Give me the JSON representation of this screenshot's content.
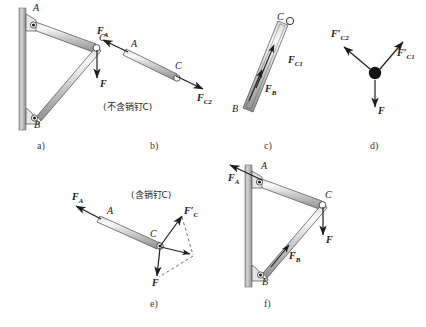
{
  "figure": {
    "background": "#ffffff",
    "ink": "#2b2b2b",
    "bar_fill_light": "#f2f2f2",
    "bar_fill_mid": "#b9b9b9",
    "wall_fill": "#b5b5b5"
  },
  "panels": [
    {
      "id": "a",
      "label": "a)",
      "caption": ""
    },
    {
      "id": "b",
      "label": "b)",
      "caption": "(不含销钉C)"
    },
    {
      "id": "c",
      "label": "c)",
      "caption": ""
    },
    {
      "id": "d",
      "label": "d)",
      "caption": ""
    },
    {
      "id": "e",
      "label": "e)",
      "caption": "(含销钉C)"
    },
    {
      "id": "f",
      "label": "f)",
      "caption": ""
    }
  ],
  "panel_a": {
    "points": [
      {
        "name": "A",
        "label": "A"
      },
      {
        "name": "B",
        "label": "B"
      },
      {
        "name": "C",
        "label": "C"
      }
    ],
    "forces": [
      {
        "name": "F",
        "label": "F",
        "direction": "down"
      }
    ]
  },
  "panel_b": {
    "note": "(不含销钉C)",
    "points": [
      {
        "name": "A",
        "label": "A"
      },
      {
        "name": "C",
        "label": "C"
      }
    ],
    "forces": [
      {
        "name": "FA",
        "base": "F",
        "sub": "A",
        "prime": "",
        "direction": "up-left"
      },
      {
        "name": "FC2",
        "base": "F",
        "sub": "C2",
        "prime": "",
        "direction": "down-right"
      }
    ]
  },
  "panel_c": {
    "points": [
      {
        "name": "B",
        "label": "B"
      },
      {
        "name": "C",
        "label": "C"
      }
    ],
    "forces": [
      {
        "name": "FC1",
        "base": "F",
        "sub": "C1",
        "prime": "",
        "direction": "up-right"
      },
      {
        "name": "FB",
        "base": "F",
        "sub": "B",
        "prime": "",
        "direction": "up-right"
      }
    ]
  },
  "panel_d": {
    "pin": "pin-C",
    "forces": [
      {
        "name": "FC2p",
        "base": "F",
        "sub": "C2",
        "prime": "′",
        "direction": "up-left"
      },
      {
        "name": "FC1p",
        "base": "F",
        "sub": "C1",
        "prime": "′",
        "direction": "up-right"
      },
      {
        "name": "F",
        "base": "F",
        "sub": "",
        "prime": "",
        "direction": "down"
      }
    ]
  },
  "panel_e": {
    "note": "(含销钉C)",
    "points": [
      {
        "name": "A",
        "label": "A"
      },
      {
        "name": "C",
        "label": "C"
      }
    ],
    "forces": [
      {
        "name": "FA",
        "base": "F",
        "sub": "A",
        "prime": "",
        "direction": "up-left"
      },
      {
        "name": "FCp",
        "base": "F",
        "sub": "C",
        "prime": "′",
        "direction": "up-right"
      },
      {
        "name": "F",
        "base": "F",
        "sub": "",
        "prime": "",
        "direction": "down"
      }
    ]
  },
  "panel_f": {
    "points": [
      {
        "name": "A",
        "label": "A"
      },
      {
        "name": "B",
        "label": "B"
      },
      {
        "name": "C",
        "label": "C"
      }
    ],
    "forces": [
      {
        "name": "FA",
        "base": "F",
        "sub": "A",
        "prime": "",
        "direction": "up-left"
      },
      {
        "name": "FB",
        "base": "F",
        "sub": "B",
        "prime": "",
        "direction": "up-right"
      },
      {
        "name": "F",
        "base": "F",
        "sub": "",
        "prime": "",
        "direction": "down"
      }
    ]
  }
}
